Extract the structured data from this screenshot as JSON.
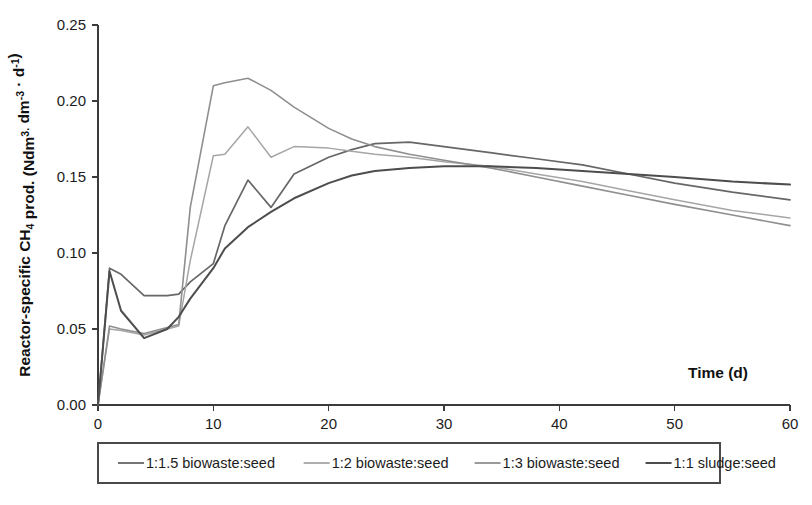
{
  "chart_data": {
    "type": "line",
    "title": "",
    "xlabel": "Time (d)",
    "ylabel": "Reactor-specific CH4 prod. (Ndm3· dm-3 · d-1)",
    "ylabel_parts": [
      {
        "text": "Reactor-specific CH",
        "style": "normal"
      },
      {
        "text": "4",
        "style": "sub"
      },
      {
        "text": " prod. (Ndm",
        "style": "normal"
      },
      {
        "text": "3.",
        "style": "sup"
      },
      {
        "text": " dm",
        "style": "normal"
      },
      {
        "text": "-3",
        "style": "sup"
      },
      {
        "text": " · d",
        "style": "normal"
      },
      {
        "text": "-1",
        "style": "sup"
      },
      {
        "text": ")",
        "style": "normal"
      }
    ],
    "xlim": [
      0,
      60
    ],
    "ylim": [
      0,
      0.25
    ],
    "xticks": [
      0,
      10,
      20,
      30,
      40,
      50,
      60
    ],
    "xtick_labels": [
      "0",
      "10",
      "20",
      "30",
      "40",
      "50",
      "60"
    ],
    "yticks": [
      0.0,
      0.05,
      0.1,
      0.15,
      0.2,
      0.25
    ],
    "ytick_labels": [
      "0.00",
      "0.05",
      "0.10",
      "0.15",
      "0.20",
      "0.25"
    ],
    "grid": false,
    "legend_position": "bottom",
    "frame": "left-bottom",
    "series": [
      {
        "name": "1:1.5 biowaste:seed",
        "color": "#676767",
        "width": 1.7,
        "x": [
          0,
          1,
          2,
          4,
          6,
          7,
          8,
          10,
          11,
          13,
          15,
          17,
          20,
          22,
          24,
          27,
          30,
          34,
          38,
          42,
          46,
          50,
          55,
          60
        ],
        "y": [
          0.0,
          0.09,
          0.086,
          0.072,
          0.072,
          0.073,
          0.081,
          0.093,
          0.118,
          0.148,
          0.13,
          0.152,
          0.163,
          0.168,
          0.172,
          0.173,
          0.17,
          0.166,
          0.162,
          0.158,
          0.152,
          0.146,
          0.14,
          0.135
        ]
      },
      {
        "name": "1:2 biowaste:seed",
        "color": "#a6a6a6",
        "width": 1.5,
        "x": [
          0,
          1,
          2,
          4,
          6,
          7,
          8,
          10,
          11,
          13,
          15,
          17,
          20,
          22,
          24,
          27,
          30,
          34,
          38,
          42,
          46,
          50,
          55,
          60
        ],
        "y": [
          0.0,
          0.05,
          0.049,
          0.046,
          0.05,
          0.052,
          0.095,
          0.164,
          0.165,
          0.183,
          0.163,
          0.17,
          0.169,
          0.167,
          0.165,
          0.163,
          0.16,
          0.157,
          0.152,
          0.147,
          0.141,
          0.135,
          0.128,
          0.123
        ]
      },
      {
        "name": "1:3 biowaste:seed",
        "color": "#8f8f8f",
        "width": 1.6,
        "x": [
          0,
          1,
          2,
          4,
          6,
          7,
          8,
          10,
          11,
          13,
          15,
          17,
          20,
          22,
          24,
          27,
          30,
          34,
          38,
          42,
          46,
          50,
          55,
          60
        ],
        "y": [
          0.0,
          0.052,
          0.05,
          0.047,
          0.051,
          0.053,
          0.13,
          0.21,
          0.212,
          0.215,
          0.207,
          0.196,
          0.182,
          0.175,
          0.17,
          0.165,
          0.161,
          0.156,
          0.15,
          0.144,
          0.138,
          0.132,
          0.125,
          0.118
        ]
      },
      {
        "name": "1:1 sludge:seed",
        "color": "#4d4d4d",
        "width": 2.0,
        "x": [
          0,
          1,
          2,
          4,
          6,
          7,
          8,
          10,
          11,
          13,
          15,
          17,
          20,
          22,
          24,
          27,
          30,
          34,
          38,
          42,
          46,
          50,
          55,
          60
        ],
        "y": [
          0.0,
          0.088,
          0.062,
          0.044,
          0.05,
          0.058,
          0.07,
          0.09,
          0.103,
          0.117,
          0.127,
          0.136,
          0.146,
          0.151,
          0.154,
          0.156,
          0.157,
          0.157,
          0.156,
          0.154,
          0.152,
          0.15,
          0.147,
          0.145
        ]
      }
    ]
  },
  "legend": {
    "entries": [
      {
        "label": "1:1.5 biowaste:seed"
      },
      {
        "label": "1:2 biowaste:seed"
      },
      {
        "label": "1:3 biowaste:seed"
      },
      {
        "label": "1:1 sludge:seed"
      }
    ]
  },
  "colors": {
    "axis": "#3b3b3b",
    "text": "#1c1c1c",
    "background": "#ffffff",
    "legend_border": "#4a4a4a"
  }
}
